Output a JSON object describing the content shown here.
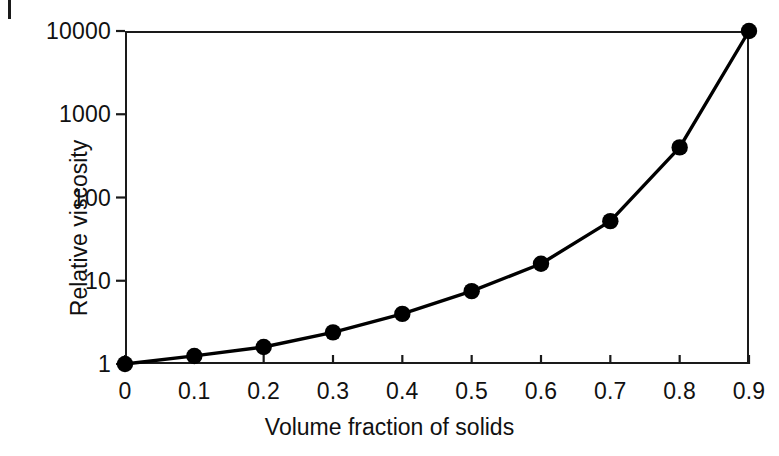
{
  "chart_data": {
    "type": "line",
    "title": "",
    "xlabel": "Volume fraction of solids",
    "ylabel": "Relative viscosity",
    "yscale": "log",
    "xlim": [
      0,
      0.9
    ],
    "ylim": [
      1,
      10000
    ],
    "grid": false,
    "legend": null,
    "marker": "filled-circle",
    "line_color": "#000000",
    "marker_color": "#000000",
    "xticks": [
      "0",
      "0.1",
      "0.2",
      "0.3",
      "0.4",
      "0.5",
      "0.6",
      "0.7",
      "0.8",
      "0.9"
    ],
    "yticks": [
      "1",
      "10",
      "100",
      "1000",
      "10000"
    ],
    "x": [
      0,
      0.1,
      0.2,
      0.3,
      0.4,
      0.5,
      0.6,
      0.7,
      0.8,
      0.9
    ],
    "values": [
      1,
      1.25,
      1.6,
      2.4,
      4,
      7.5,
      16,
      52,
      400,
      10000
    ],
    "series": [
      {
        "name": "Relative viscosity",
        "x": [
          0,
          0.1,
          0.2,
          0.3,
          0.4,
          0.5,
          0.6,
          0.7,
          0.8,
          0.9
        ],
        "values": [
          1,
          1.25,
          1.6,
          2.4,
          4,
          7.5,
          16,
          52,
          400,
          10000
        ]
      }
    ]
  },
  "figure": {
    "background": "#ffffff",
    "axis_color": "#1a1a1a"
  }
}
